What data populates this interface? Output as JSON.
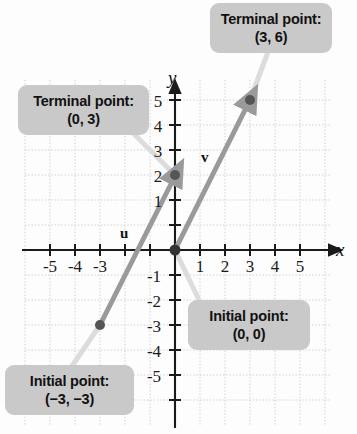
{
  "figure": {
    "type": "vector-diagram",
    "axes": {
      "x_label": "x",
      "y_label": "y",
      "x_ticks": [
        "-5",
        "-4",
        "-3",
        "1",
        "2",
        "3",
        "4",
        "5"
      ],
      "y_ticks": [
        "5",
        "4",
        "3",
        "2",
        "1",
        "-1",
        "-2",
        "-3",
        "-4",
        "-5"
      ],
      "x_range": [
        -6,
        6
      ],
      "y_range": [
        -6,
        6
      ],
      "grid": "dotted"
    },
    "vectors": [
      {
        "name": "u",
        "label": "u",
        "initial_point": [
          -3,
          -3
        ],
        "terminal_point": [
          0,
          3
        ],
        "color": "#9a9a9a"
      },
      {
        "name": "v",
        "label": "v",
        "initial_point": [
          0,
          0
        ],
        "terminal_point": [
          3,
          6
        ],
        "color": "#9a9a9a"
      }
    ],
    "points": [
      {
        "name": "u-initial",
        "coords": [
          -3,
          -3
        ]
      },
      {
        "name": "u-terminal",
        "coords": [
          0,
          3
        ]
      },
      {
        "name": "v-initial",
        "coords": [
          0,
          0
        ]
      },
      {
        "name": "v-terminal",
        "coords": [
          3,
          6
        ]
      }
    ]
  },
  "callouts": {
    "terminal_36": {
      "line1": "Terminal point:",
      "line2": "(3, 6)"
    },
    "terminal_03": {
      "line1": "Terminal point:",
      "line2": "(0, 3)"
    },
    "initial_00": {
      "line1": "Initial point:",
      "line2": "(0, 0)"
    },
    "initial_33": {
      "line1": "Initial point:",
      "line2": "(−3, −3)"
    }
  },
  "colors": {
    "callout_background": "#c9c9c9",
    "vector": "#9a9a9a",
    "point": "#555555",
    "axis": "#1a1a1a",
    "grid": "#cfcfcf",
    "leader": "#d8d8d8"
  }
}
